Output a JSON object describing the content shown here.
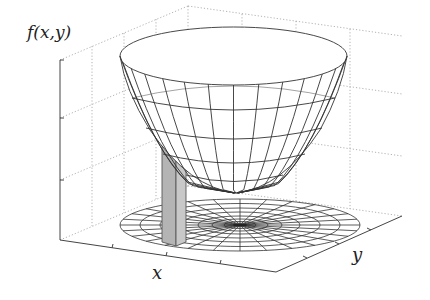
{
  "figure": {
    "type": "3d-surface-plot",
    "labels": {
      "zlabel": "f(x,y)",
      "xlabel": "x",
      "ylabel": "y"
    },
    "colors": {
      "mesh": "#333333",
      "grid": "#999999",
      "bar_fill": "#b8b8b8",
      "bar_edge": "#555555",
      "background": "#ffffff"
    }
  }
}
